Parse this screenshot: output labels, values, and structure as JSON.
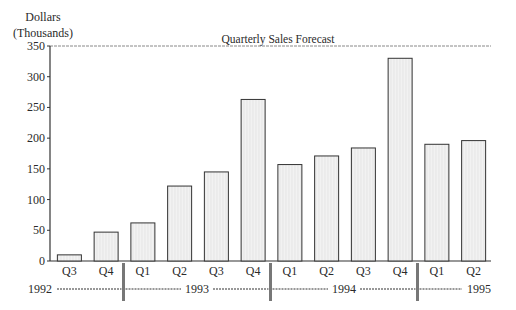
{
  "chart_data": {
    "type": "bar",
    "title": "Quarterly Sales Forecast",
    "xlabel": "",
    "ylabel": "Dollars (Thousands)",
    "ylabel_lines": [
      "Dollars",
      "(Thousands)"
    ],
    "ylim": [
      0,
      350
    ],
    "yticks": [
      0,
      50,
      100,
      150,
      200,
      250,
      300,
      350
    ],
    "grid": false,
    "legend": null,
    "categories": [
      "Q3",
      "Q4",
      "Q1",
      "Q2",
      "Q3",
      "Q4",
      "Q1",
      "Q2",
      "Q3",
      "Q4",
      "Q1",
      "Q2"
    ],
    "years": [
      {
        "label": "1992",
        "start": 0,
        "end": 1
      },
      {
        "label": "1993",
        "start": 2,
        "end": 5
      },
      {
        "label": "1994",
        "start": 6,
        "end": 9
      },
      {
        "label": "1995",
        "start": 10,
        "end": 11
      }
    ],
    "series": [
      {
        "name": "Sales",
        "values": [
          10,
          47,
          62,
          122,
          145,
          263,
          157,
          171,
          184,
          330,
          190,
          196
        ]
      }
    ]
  },
  "colors": {
    "bar_fill": "#f2f2f2",
    "bar_stroke": "#333333",
    "axis": "#333333",
    "divider": "#777777"
  }
}
